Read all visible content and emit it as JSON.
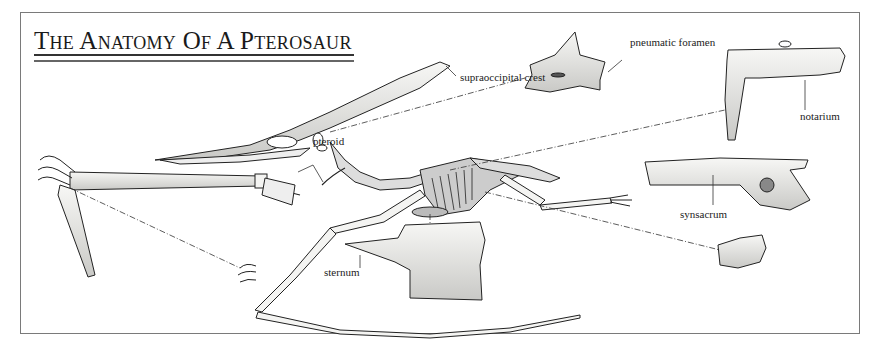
{
  "figure": {
    "title": "The Anatomy Of A Pterosaur",
    "labels": {
      "supraoccipital_crest": "supraoccipital crest",
      "pneumatic_foramen": "pneumatic foramen",
      "notarium": "notarium",
      "pteroid": "pteroid",
      "sternum": "sternum",
      "synsacrum": "synsacrum"
    },
    "colors": {
      "frame": "#7a7a7a",
      "ink": "#222222",
      "bone_fill": "#f4f4f2",
      "shade": "#bdbdbd"
    }
  }
}
